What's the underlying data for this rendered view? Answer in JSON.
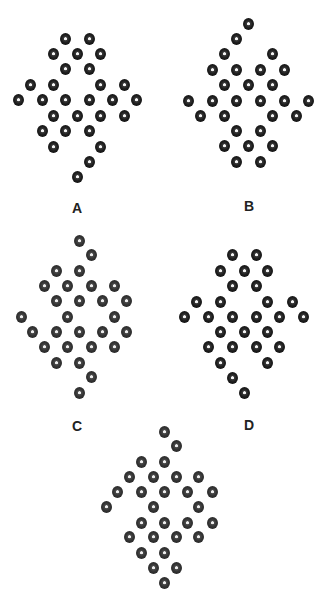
{
  "figures": [
    {
      "id": "A",
      "label": "A",
      "label_pos": [
        77,
        208
      ],
      "dots": [
        [
          65,
          39
        ],
        [
          89,
          39
        ],
        [
          53,
          54
        ],
        [
          77,
          54
        ],
        [
          100,
          54
        ],
        [
          65,
          69
        ],
        [
          89,
          69
        ],
        [
          30,
          85
        ],
        [
          53,
          85
        ],
        [
          100,
          85
        ],
        [
          124,
          85
        ],
        [
          18,
          100
        ],
        [
          42,
          100
        ],
        [
          65,
          100
        ],
        [
          89,
          100
        ],
        [
          112,
          100
        ],
        [
          136,
          100
        ],
        [
          53,
          116
        ],
        [
          77,
          116
        ],
        [
          100,
          116
        ],
        [
          124,
          116
        ],
        [
          42,
          131
        ],
        [
          65,
          131
        ],
        [
          89,
          131
        ],
        [
          53,
          147
        ],
        [
          100,
          147
        ],
        [
          89,
          162
        ],
        [
          77,
          177
        ]
      ]
    },
    {
      "id": "B",
      "label": "B",
      "label_pos": [
        249,
        206
      ],
      "dots": [
        [
          248,
          24
        ],
        [
          236,
          39
        ],
        [
          224,
          54
        ],
        [
          272,
          54
        ],
        [
          212,
          70
        ],
        [
          236,
          70
        ],
        [
          260,
          70
        ],
        [
          284,
          70
        ],
        [
          224,
          85
        ],
        [
          248,
          85
        ],
        [
          272,
          85
        ],
        [
          188,
          101
        ],
        [
          212,
          101
        ],
        [
          236,
          101
        ],
        [
          260,
          101
        ],
        [
          284,
          101
        ],
        [
          308,
          101
        ],
        [
          200,
          116
        ],
        [
          224,
          116
        ],
        [
          272,
          116
        ],
        [
          296,
          116
        ],
        [
          236,
          131
        ],
        [
          260,
          131
        ],
        [
          224,
          146
        ],
        [
          248,
          146
        ],
        [
          272,
          146
        ],
        [
          236,
          162
        ],
        [
          260,
          162
        ]
      ]
    },
    {
      "id": "C",
      "label": "C",
      "label_pos": [
        77,
        426
      ],
      "dots": [
        [
          79,
          241
        ],
        [
          91,
          255
        ],
        [
          56,
          271
        ],
        [
          79,
          271
        ],
        [
          44,
          286
        ],
        [
          67,
          286
        ],
        [
          91,
          286
        ],
        [
          114,
          286
        ],
        [
          56,
          301
        ],
        [
          79,
          301
        ],
        [
          102,
          301
        ],
        [
          126,
          301
        ],
        [
          21,
          317
        ],
        [
          67,
          317
        ],
        [
          114,
          317
        ],
        [
          32,
          332
        ],
        [
          56,
          332
        ],
        [
          79,
          332
        ],
        [
          102,
          332
        ],
        [
          126,
          332
        ],
        [
          44,
          347
        ],
        [
          67,
          347
        ],
        [
          91,
          347
        ],
        [
          114,
          347
        ],
        [
          56,
          363
        ],
        [
          79,
          363
        ],
        [
          91,
          377
        ],
        [
          79,
          393
        ]
      ]
    },
    {
      "id": "D",
      "label": "D",
      "label_pos": [
        249,
        425
      ],
      "dots": [
        [
          232,
          255
        ],
        [
          256,
          255
        ],
        [
          220,
          271
        ],
        [
          244,
          271
        ],
        [
          267,
          271
        ],
        [
          232,
          286
        ],
        [
          256,
          286
        ],
        [
          196,
          302
        ],
        [
          220,
          302
        ],
        [
          267,
          302
        ],
        [
          292,
          302
        ],
        [
          184,
          317
        ],
        [
          208,
          317
        ],
        [
          232,
          317
        ],
        [
          256,
          317
        ],
        [
          279,
          317
        ],
        [
          303,
          317
        ],
        [
          220,
          332
        ],
        [
          244,
          332
        ],
        [
          267,
          332
        ],
        [
          208,
          347
        ],
        [
          232,
          347
        ],
        [
          256,
          347
        ],
        [
          279,
          347
        ],
        [
          220,
          363
        ],
        [
          267,
          363
        ],
        [
          232,
          378
        ],
        [
          244,
          393
        ]
      ]
    },
    {
      "id": "E",
      "label": "",
      "label_pos": null,
      "dots": [
        [
          164,
          432
        ],
        [
          176,
          446
        ],
        [
          141,
          462
        ],
        [
          164,
          462
        ],
        [
          129,
          477
        ],
        [
          153,
          477
        ],
        [
          176,
          477
        ],
        [
          198,
          477
        ],
        [
          117,
          492
        ],
        [
          141,
          492
        ],
        [
          164,
          492
        ],
        [
          187,
          492
        ],
        [
          212,
          492
        ],
        [
          106,
          507
        ],
        [
          153,
          507
        ],
        [
          198,
          507
        ],
        [
          141,
          523
        ],
        [
          164,
          523
        ],
        [
          187,
          523
        ],
        [
          212,
          523
        ],
        [
          129,
          537
        ],
        [
          153,
          537
        ],
        [
          176,
          537
        ],
        [
          198,
          537
        ],
        [
          141,
          553
        ],
        [
          164,
          553
        ],
        [
          153,
          568
        ],
        [
          176,
          568
        ],
        [
          164,
          583
        ]
      ]
    }
  ]
}
